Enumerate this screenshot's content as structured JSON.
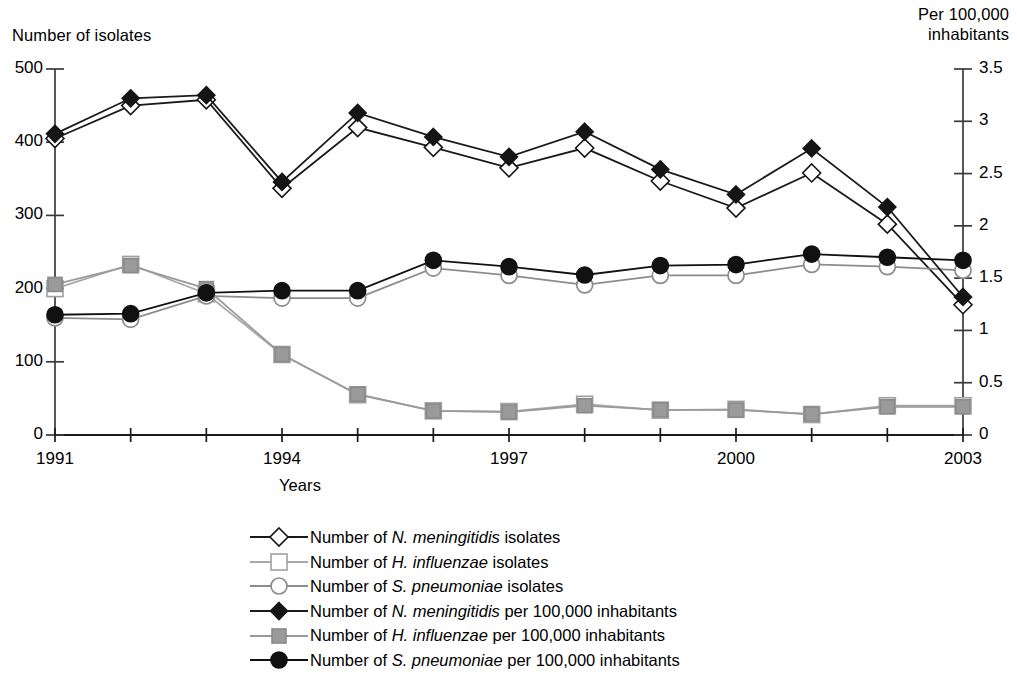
{
  "chart_data": {
    "type": "line",
    "title": "",
    "xlabel": "Years",
    "ylabel_left": "Number of isolates",
    "ylabel_right": "Per 100,000 inhabitants",
    "grid": false,
    "legend_position": "bottom",
    "x": [
      1991,
      1992,
      1993,
      1994,
      1995,
      1996,
      1997,
      1998,
      1999,
      2000,
      2001,
      2002,
      2003
    ],
    "xtick_labels": [
      "1991",
      "",
      "",
      "1994",
      "",
      "",
      "1997",
      "",
      "",
      "2000",
      "",
      "",
      "2003"
    ],
    "xlim": [
      1991,
      2003
    ],
    "ylim_left": [
      0,
      500
    ],
    "ytick_labels_left": [
      "0",
      "100",
      "200",
      "300",
      "400",
      "500"
    ],
    "ytick_values_left": [
      0,
      100,
      200,
      300,
      400,
      500
    ],
    "ylim_right": [
      0,
      3.5
    ],
    "ytick_labels_right": [
      "0",
      "0.5",
      "1",
      "1.5",
      "2",
      "2.5",
      "3",
      "3.5"
    ],
    "ytick_values_right": [
      0,
      0.5,
      1,
      1.5,
      2,
      2.5,
      3,
      3.5
    ],
    "series": [
      {
        "name": "Number of N. meningitidis isolates",
        "genus": "N. meningitidis",
        "prefix": "Number of ",
        "suffix": " isolates",
        "marker": "open-diamond",
        "axis": "left",
        "color": "#1a1a1a",
        "values": [
          405,
          450,
          458,
          337,
          420,
          393,
          365,
          392,
          347,
          310,
          358,
          288,
          178
        ]
      },
      {
        "name": "Number of H. influenzae isolates",
        "genus": "H. influenzae",
        "prefix": "Number of ",
        "suffix": " isolates",
        "marker": "open-square",
        "axis": "left",
        "color": "#a8a8a8",
        "values": [
          200,
          233,
          193,
          110,
          55,
          33,
          32,
          42,
          34,
          35,
          28,
          40,
          40
        ]
      },
      {
        "name": "Number of S. pneumoniae isolates",
        "genus": "S. pneumoniae",
        "prefix": "Number of ",
        "suffix": " isolates",
        "marker": "open-circle",
        "axis": "left",
        "color": "#8c8c8c",
        "values": [
          160,
          158,
          190,
          187,
          187,
          228,
          218,
          205,
          218,
          218,
          233,
          230,
          225
        ]
      },
      {
        "name": "Number of N. meningitidis per 100,000 inhabitants",
        "genus": "N. meningitidis",
        "prefix": "Number of ",
        "suffix": " per 100,000 inhabitants",
        "marker": "filled-diamond",
        "axis": "right",
        "color": "#1a1a1a",
        "values": [
          2.88,
          3.22,
          3.25,
          2.42,
          3.08,
          2.85,
          2.66,
          2.9,
          2.54,
          2.3,
          2.74,
          2.18,
          1.32
        ]
      },
      {
        "name": "Number of H. influenzae per 100,000 inhabitants",
        "genus": "H. influenzae",
        "prefix": "Number of ",
        "suffix": " per 100,000 inhabitants",
        "marker": "filled-square",
        "axis": "right",
        "color": "#9a9a9a",
        "values": [
          1.44,
          1.62,
          1.4,
          0.77,
          0.39,
          0.23,
          0.22,
          0.28,
          0.24,
          0.24,
          0.2,
          0.27,
          0.27
        ]
      },
      {
        "name": "Number of S. pneumoniae per 100,000 inhabitants",
        "genus": "S. pneumoniae",
        "prefix": "Number of ",
        "suffix": " per 100,000 inhabitants",
        "marker": "filled-circle",
        "axis": "right",
        "color": "#111111",
        "values": [
          1.15,
          1.16,
          1.36,
          1.38,
          1.38,
          1.67,
          1.61,
          1.53,
          1.62,
          1.63,
          1.73,
          1.7,
          1.67
        ]
      }
    ]
  }
}
